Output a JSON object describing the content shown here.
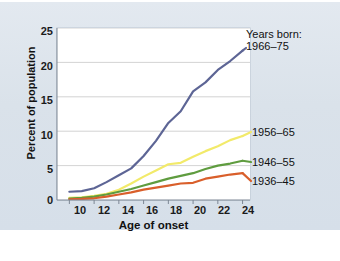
{
  "chart_data": {
    "type": "line",
    "title": "",
    "subtitle": "",
    "xlabel": "Age of onset",
    "ylabel": "Percent of population",
    "xlim": [
      9,
      24.6
    ],
    "ylim": [
      0,
      25
    ],
    "xticks": [
      "10",
      "12",
      "14",
      "16",
      "18",
      "20",
      "22",
      "24"
    ],
    "xtick_values": [
      10,
      12,
      14,
      16,
      18,
      20,
      22,
      24
    ],
    "yticks": [
      "0",
      "5",
      "10",
      "15",
      "20",
      "25"
    ],
    "ytick_values": [
      0,
      5,
      10,
      15,
      20,
      25
    ],
    "grid": "horizontal",
    "legend_position": "line-end-labels",
    "legend_title": "Years born:",
    "x": [
      10,
      11,
      12,
      13,
      14,
      15,
      16,
      17,
      18,
      19,
      20,
      21,
      22,
      23,
      24
    ],
    "series": [
      {
        "name": "1966–75",
        "color": "#5d6595",
        "values": [
          1.2,
          1.3,
          1.7,
          2.6,
          3.6,
          4.6,
          6.4,
          8.6,
          11.2,
          12.9,
          15.8,
          17.1,
          18.9,
          20.2,
          21.7
        ]
      },
      {
        "name": "1956–65",
        "color": "#f2ea6a",
        "values": [
          0.3,
          0.4,
          0.6,
          0.9,
          1.5,
          2.4,
          3.4,
          4.3,
          5.2,
          5.4,
          6.3,
          7.1,
          7.8,
          8.7,
          9.3
        ]
      },
      {
        "name": "1946–55",
        "color": "#5f9c3f",
        "values": [
          0.2,
          0.3,
          0.5,
          0.8,
          1.2,
          1.6,
          2.1,
          2.6,
          3.1,
          3.5,
          3.9,
          4.5,
          5.0,
          5.3,
          5.7
        ]
      },
      {
        "name": "1936–45",
        "color": "#d95f2b",
        "values": [
          0.1,
          0.15,
          0.25,
          0.5,
          0.8,
          1.1,
          1.5,
          1.8,
          2.1,
          2.4,
          2.5,
          3.1,
          3.4,
          3.7,
          3.9
        ]
      }
    ],
    "end_labels": [
      {
        "name": "1966–75",
        "x": 246,
        "y": 40
      },
      {
        "name": "1956–65",
        "x": 252,
        "y": 126
      },
      {
        "name": "1946–55",
        "x": 252,
        "y": 156
      },
      {
        "name": "1936–45",
        "x": 252,
        "y": 175
      }
    ]
  },
  "colors": {
    "panel_background": "#dde4ec",
    "plot_background": "#ffffff",
    "gridline": "#c8c8c8",
    "axis": "#6f6f6f",
    "text": "#111111"
  }
}
